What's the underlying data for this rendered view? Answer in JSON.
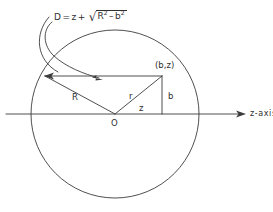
{
  "figure": {
    "name": "geometry-diagram-chord-sphere",
    "background_color": "#ffffff",
    "ink_color": "#3b3b3b",
    "formula": {
      "lhs": "D",
      "equals": "=",
      "term1": "z",
      "plus": "+",
      "radical_sign": "√",
      "radicand_base1": "R",
      "radicand_exp1": "2",
      "radicand_minus": "–",
      "radicand_base2": "b",
      "radicand_exp2": "2",
      "full_text": "D = z + √(R² – b²)"
    },
    "labels": {
      "point": "(b,z)",
      "radius": "R",
      "r": "r",
      "b": "b",
      "z": "z",
      "origin": "O",
      "axis": "z-axis"
    },
    "geometry": {
      "circle_center_x": 115,
      "circle_center_y": 114,
      "circle_radius": 84,
      "axis_y": 114,
      "axis_x_start": 6,
      "axis_x_end": 246,
      "point_x": 162,
      "point_y": 76,
      "chord_left_x": 45,
      "chord_y": 76
    }
  }
}
